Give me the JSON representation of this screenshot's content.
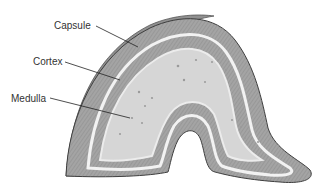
{
  "diagram": {
    "labels": [
      {
        "id": "capsule",
        "text": "Capsule",
        "x": 54,
        "y": 21
      },
      {
        "id": "cortex",
        "text": "Cortex",
        "x": 33,
        "y": 57
      },
      {
        "id": "medulla",
        "text": "Medulla",
        "x": 11,
        "y": 94
      }
    ],
    "colors": {
      "capsule": "#8e8e8e",
      "cortex": "#a9a9a9",
      "medulla": "#d4d4d4",
      "outline": "#4a4a4a",
      "leader": "#222222"
    }
  }
}
